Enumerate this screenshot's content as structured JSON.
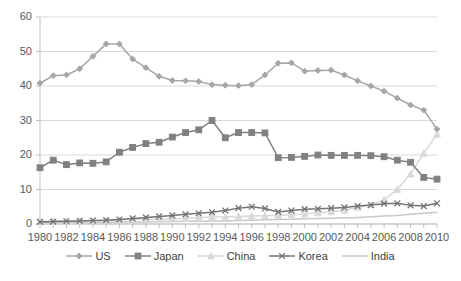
{
  "chart_data": {
    "type": "line",
    "title": "",
    "xlabel": "",
    "ylabel": "",
    "xlim": [
      1980,
      2010
    ],
    "ylim": [
      0,
      60
    ],
    "yticks": [
      0,
      10,
      20,
      30,
      40,
      50,
      60
    ],
    "xticks": [
      1980,
      1982,
      1984,
      1986,
      1988,
      1990,
      1992,
      1994,
      1996,
      1998,
      2000,
      2002,
      2004,
      2006,
      2008,
      2010
    ],
    "grid": true,
    "legend_position": "bottom",
    "x": [
      1980,
      1981,
      1982,
      1983,
      1984,
      1985,
      1986,
      1987,
      1988,
      1989,
      1990,
      1991,
      1992,
      1993,
      1994,
      1995,
      1996,
      1997,
      1998,
      1999,
      2000,
      2001,
      2002,
      2003,
      2004,
      2005,
      2006,
      2007,
      2008,
      2009,
      2010
    ],
    "series": [
      {
        "name": "US",
        "color": "#a6a6a6",
        "marker": "diamond",
        "values": [
          40.8,
          43.0,
          43.2,
          45.0,
          48.6,
          52.2,
          52.2,
          47.8,
          45.3,
          42.8,
          41.6,
          41.5,
          41.3,
          40.4,
          40.2,
          40.1,
          40.4,
          43.2,
          46.6,
          46.7,
          44.3,
          44.5,
          44.6,
          43.2,
          41.5,
          40.0,
          38.5,
          36.5,
          34.5,
          33.0,
          27.5
        ]
      },
      {
        "name": "Japan",
        "color": "#808080",
        "marker": "square",
        "values": [
          16.3,
          18.5,
          17.2,
          17.7,
          17.6,
          18.0,
          20.8,
          22.2,
          23.3,
          23.7,
          25.2,
          26.5,
          27.3,
          30.0,
          25.0,
          26.5,
          26.5,
          26.4,
          19.2,
          19.3,
          19.6,
          20.0,
          19.9,
          19.9,
          19.9,
          19.8,
          19.5,
          18.5,
          17.9,
          13.5,
          13.0
        ]
      },
      {
        "name": "China",
        "color": "#d9d9d9",
        "marker": "triangle",
        "values": [
          0.8,
          0.8,
          0.9,
          0.9,
          1.0,
          1.1,
          1.2,
          1.3,
          1.4,
          1.4,
          1.5,
          1.6,
          1.8,
          2.0,
          2.1,
          2.2,
          2.3,
          2.4,
          2.5,
          2.7,
          2.9,
          3.2,
          3.5,
          4.0,
          4.8,
          5.6,
          7.0,
          10.0,
          14.5,
          20.5,
          26.0
        ]
      },
      {
        "name": "Korea",
        "color": "#737373",
        "marker": "cross",
        "values": [
          0.6,
          0.7,
          0.8,
          0.9,
          1.0,
          1.1,
          1.3,
          1.6,
          1.9,
          2.2,
          2.5,
          2.8,
          3.1,
          3.4,
          3.9,
          4.6,
          5.0,
          4.5,
          3.5,
          3.9,
          4.3,
          4.4,
          4.6,
          4.8,
          5.2,
          5.5,
          5.9,
          6.0,
          5.4,
          5.2,
          6.0
        ]
      },
      {
        "name": "India",
        "color": "#c8c8c8",
        "marker": "none",
        "values": [
          0.4,
          0.4,
          0.4,
          0.5,
          0.5,
          0.5,
          0.6,
          0.6,
          0.6,
          0.7,
          0.7,
          0.8,
          0.8,
          0.9,
          0.9,
          1.0,
          1.1,
          1.2,
          1.3,
          1.4,
          1.5,
          1.6,
          1.7,
          1.8,
          1.9,
          2.1,
          2.3,
          2.5,
          2.8,
          3.1,
          3.4
        ]
      }
    ]
  },
  "axes": {
    "ytick_labels": [
      "60",
      "50",
      "40",
      "30",
      "20",
      "10",
      "0"
    ],
    "xtick_labels": [
      "1980",
      "1982",
      "1984",
      "1986",
      "1988",
      "1990",
      "1992",
      "1994",
      "1996",
      "1998",
      "2000",
      "2002",
      "2004",
      "2006",
      "2008",
      "2010"
    ]
  },
  "legend": {
    "items": [
      {
        "label": "US",
        "marker_icon": "diamond-marker-icon",
        "color": "#a6a6a6"
      },
      {
        "label": "Japan",
        "marker_icon": "square-marker-icon",
        "color": "#808080"
      },
      {
        "label": "China",
        "marker_icon": "triangle-marker-icon",
        "color": "#d9d9d9"
      },
      {
        "label": "Korea",
        "marker_icon": "cross-marker-icon",
        "color": "#737373"
      },
      {
        "label": "India",
        "marker_icon": "line-marker-icon",
        "color": "#c8c8c8"
      }
    ]
  },
  "style": {
    "background": "#ffffff",
    "gridline_color": "#d9d9d9",
    "axis_color": "#bfbfbf",
    "tick_text_color": "#595959"
  }
}
